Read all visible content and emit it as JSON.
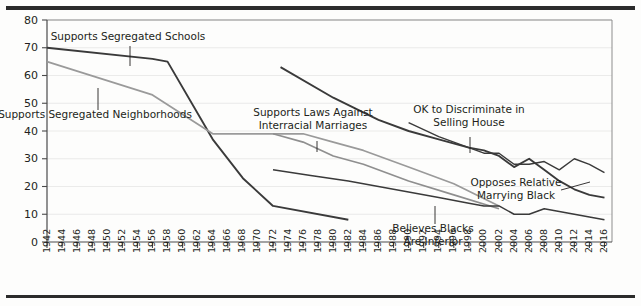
{
  "figure": {
    "title": "",
    "top_rule_color": "#2b2b2b",
    "bottom_rule_color": "#2b2b2b",
    "background": "#fdfdfc"
  },
  "chart_data": {
    "type": "line",
    "title": "",
    "xlabel": "",
    "ylabel": "",
    "xlim": [
      1942,
      2017
    ],
    "ylim": [
      0,
      80
    ],
    "yticks": [
      0,
      10,
      20,
      30,
      40,
      50,
      60,
      70,
      80
    ],
    "xticks": [
      1942,
      1944,
      1946,
      1948,
      1950,
      1952,
      1954,
      1956,
      1958,
      1960,
      1962,
      1964,
      1966,
      1968,
      1970,
      1972,
      1974,
      1976,
      1978,
      1980,
      1982,
      1984,
      1986,
      1988,
      1990,
      1992,
      1994,
      1996,
      1998,
      2000,
      2002,
      2004,
      2006,
      2008,
      2010,
      2012,
      2014,
      2016
    ],
    "grid": "horizontal",
    "legend_position": "inline-annotations",
    "series": [
      {
        "name": "Supports Segregated Schools",
        "color": "#3a3a3a",
        "width": 1.9,
        "x": [
          1942,
          1956,
          1958,
          1964,
          1968,
          1972,
          1982
        ],
        "values": [
          70,
          66,
          65,
          37,
          23,
          13,
          8
        ]
      },
      {
        "name": "Supports Segregated Neighborhoods",
        "color": "#9a9a9a",
        "width": 1.7,
        "x": [
          1942,
          1956,
          1964,
          1968,
          1972,
          1976,
          1980,
          1984,
          1990,
          1996,
          2002
        ],
        "values": [
          65,
          53,
          39,
          39,
          39,
          39,
          36,
          33,
          27,
          21,
          13
        ]
      },
      {
        "name": "Supports Laws Against Interracial Marriages",
        "color": "#8f8f8f",
        "width": 1.7,
        "x": [
          1972,
          1976,
          1980,
          1984,
          1990,
          1996,
          2002
        ],
        "values": [
          39,
          36,
          31,
          28,
          22,
          17,
          12
        ]
      },
      {
        "name": "OK to Discriminate in Selling House",
        "color": "#3a3a3a",
        "width": 1.9,
        "x": [
          1973,
          1980,
          1986,
          1990,
          1994,
          1998,
          2000,
          2002,
          2004,
          2006,
          2008,
          2010,
          2012,
          2014,
          2016
        ],
        "values": [
          63,
          52,
          44,
          40,
          37,
          34,
          33,
          31,
          27,
          30,
          26,
          22,
          19,
          17,
          16
        ]
      },
      {
        "name": "Opposes Relative Marrying Black",
        "color": "#3a3a3a",
        "width": 1.4,
        "x": [
          1990,
          1994,
          1998,
          2000,
          2002,
          2004,
          2006,
          2008,
          2010,
          2012,
          2014,
          2016
        ],
        "values": [
          43,
          38,
          34,
          32,
          32,
          28,
          28,
          29,
          26,
          30,
          28,
          25
        ]
      },
      {
        "name": "Believes Blacks Are Inferior",
        "color": "#3a3a3a",
        "width": 1.5,
        "x": [
          1972,
          1977,
          1982,
          1988,
          1994,
          1998,
          2000,
          2002,
          2004,
          2006,
          2008,
          2010,
          2012,
          2014,
          2016
        ],
        "values": [
          26,
          24,
          22,
          19,
          16,
          14,
          13,
          13,
          10,
          10,
          12,
          11,
          10,
          9,
          8
        ]
      }
    ],
    "annotations": [
      {
        "label": "Supports Segregated Schools",
        "lines": [
          "Supports Segregated Schools"
        ],
        "text_x": 128,
        "text_y": 40,
        "leader_x": 130,
        "leader_y1": 46,
        "leader_y2": 66
      },
      {
        "label": "Supports Segregated Neighborhoods",
        "lines": [
          "Supports Segregated Neighborhoods"
        ],
        "text_x": 95,
        "text_y": 118,
        "leader_x": 98,
        "leader_y1": 88,
        "leader_y2": 110
      },
      {
        "label": "Supports Laws Against Interracial Marriages",
        "lines": [
          "Supports Laws Against",
          "Interracial Marriages"
        ],
        "text_x": 313,
        "text_y": 116,
        "leader_x": 317,
        "leader_y1": 141,
        "leader_y2": 152
      },
      {
        "label": "OK to Discriminate in Selling House",
        "lines": [
          "OK to Discriminate in",
          "Selling House"
        ],
        "text_x": 469,
        "text_y": 113,
        "leader_x": 470,
        "leader_y1": 137,
        "leader_y2": 153
      },
      {
        "label": "Opposes Relative Marrying Black",
        "lines": [
          "Opposes Relative",
          "Marrying Black"
        ],
        "text_x": 516,
        "text_y": 186,
        "leader_x1": 561,
        "leader_y1": 190,
        "leader_x2": 590,
        "leader_y2": 182
      },
      {
        "label": "Believes Blacks Are Inferior",
        "lines": [
          "Believes Blacks",
          "Are Inferior"
        ],
        "text_x": 433,
        "text_y": 232,
        "leader_x": 435,
        "leader_y1": 206,
        "leader_y2": 224
      }
    ]
  }
}
